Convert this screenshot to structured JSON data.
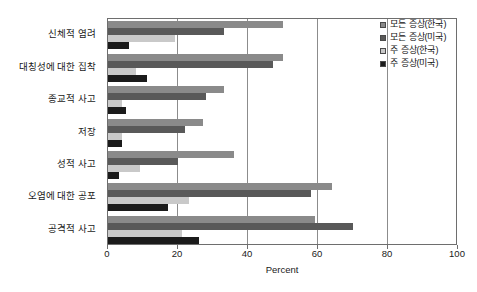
{
  "chart_data": {
    "type": "bar",
    "orientation": "horizontal",
    "title": "",
    "xlabel": "Percent",
    "ylabel": "",
    "xlim": [
      0,
      100
    ],
    "xticks": [
      "0",
      "20",
      "40",
      "60",
      "80",
      "100"
    ],
    "grid": "vertical",
    "legend_position": "top-right",
    "categories": [
      "신체적 염려",
      "대칭성에 대한 집착",
      "종교적 사고",
      "저장",
      "성적 사고",
      "오염에 대한 공포",
      "공격적 사고"
    ],
    "series": [
      {
        "name": "모든 증상(한국)",
        "color": "#8a8a8a",
        "values": [
          50,
          50,
          33,
          27,
          36,
          64,
          59
        ]
      },
      {
        "name": "모든 증상(미국)",
        "color": "#595959",
        "values": [
          33,
          47,
          28,
          22,
          20,
          58,
          70
        ]
      },
      {
        "name": "주 증상(한국)",
        "color": "#c9c9c9",
        "values": [
          19,
          8,
          4,
          4,
          9,
          23,
          21
        ]
      },
      {
        "name": "주 증상(미국)",
        "color": "#1b1b1b",
        "values": [
          6,
          11,
          5,
          4,
          3,
          17,
          26
        ]
      }
    ]
  },
  "legend": {
    "items": [
      {
        "label": "모든 증상(한국)",
        "color": "#8a8a8a"
      },
      {
        "label": "모든 증상(미국)",
        "color": "#595959"
      },
      {
        "label": "주 증상(한국)",
        "color": "#c9c9c9"
      },
      {
        "label": "주 증상(미국)",
        "color": "#1b1b1b"
      }
    ]
  },
  "axis": {
    "x_title": "Percent",
    "x_ticks": [
      "0",
      "20",
      "40",
      "60",
      "80",
      "100"
    ]
  }
}
